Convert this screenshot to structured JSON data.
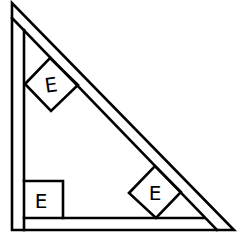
{
  "diagram": {
    "type": "right-triangle-frame",
    "boxes": [
      {
        "id": "box-upper-left-diamond",
        "label": "E"
      },
      {
        "id": "box-lower-right-diamond",
        "label": "E"
      },
      {
        "id": "box-bottom-left-square",
        "label": "E"
      }
    ]
  }
}
